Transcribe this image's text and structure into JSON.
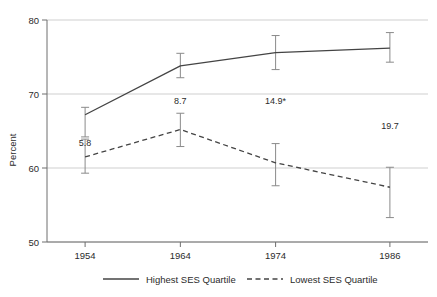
{
  "chart_data": {
    "type": "line",
    "title": "",
    "xlabel": "",
    "ylabel": "Percent",
    "x": [
      1954,
      1964,
      1974,
      1986
    ],
    "categories": [
      "1954",
      "1964",
      "1974",
      "1986"
    ],
    "xtick_labels": [
      "1954",
      "1964",
      "1974",
      "1986"
    ],
    "ytick_labels": [
      "50",
      "60",
      "70",
      "80"
    ],
    "yticks": [
      50,
      60,
      70,
      80
    ],
    "ylim": [
      50,
      80
    ],
    "xlim": [
      1950,
      1990
    ],
    "grid": "horizontal",
    "legend_position": "bottom",
    "series": [
      {
        "name": "Highest SES Quartile",
        "style": "solid",
        "color": "#444444",
        "values": [
          67.2,
          73.8,
          75.6,
          76.2
        ],
        "error_high": [
          68.2,
          75.5,
          77.9,
          78.3
        ],
        "error_low": [
          64.2,
          72.2,
          73.3,
          74.3
        ]
      },
      {
        "name": "Lowest SES Quartile",
        "style": "dashed",
        "color": "#444444",
        "values": [
          61.5,
          65.2,
          60.7,
          57.4
        ],
        "error_high": [
          63.9,
          67.4,
          63.3,
          60.1
        ],
        "error_low": [
          59.3,
          62.9,
          57.6,
          53.3
        ]
      }
    ],
    "annotations": [
      {
        "text": "5.8",
        "x": 1954,
        "y": 63.0
      },
      {
        "text": "8.7",
        "x": 1964,
        "y": 68.6
      },
      {
        "text": "14.9*",
        "x": 1974,
        "y": 68.6
      },
      {
        "text": "19.7",
        "x": 1986,
        "y": 65.3
      }
    ]
  },
  "legend": {
    "items": [
      {
        "label": "Highest SES Quartile",
        "style": "solid"
      },
      {
        "label": "Lowest SES Quartile",
        "style": "dashed"
      }
    ]
  },
  "axes": {
    "y_title": "Percent"
  },
  "colors": {
    "line": "#444444",
    "grid": "#cfcfcf",
    "axis": "#6e6e6e",
    "text": "#2b2b2b"
  }
}
